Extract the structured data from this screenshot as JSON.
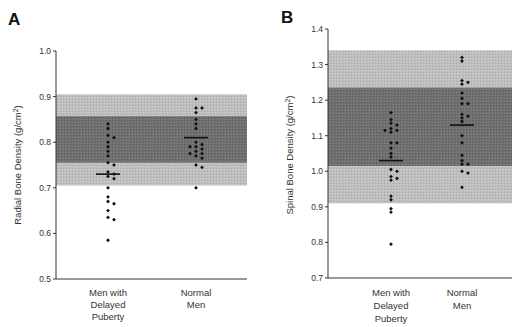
{
  "chart_data": [
    {
      "type": "scatter",
      "panel_label": "A",
      "title": "",
      "xlabel": "",
      "ylabel": "Radial Bone Density (g/cm²)",
      "ylabel_base": "Radial Bone Density (g/cm",
      "ylabel_sup": "2",
      "ylabel_end": ")",
      "ylim": [
        0.5,
        1.0
      ],
      "yticks": [
        "1.0",
        "0.9",
        "0.8",
        "0.7",
        "0.6",
        "0.5"
      ],
      "grid": false,
      "reference_bands": {
        "outer": {
          "low": 0.705,
          "high": 0.905,
          "color": "#bdbdbd"
        },
        "inner": {
          "low": 0.755,
          "high": 0.857,
          "color": "#6e6e6e"
        }
      },
      "categories": [
        "Men with Delayed Puberty",
        "Normal Men"
      ],
      "category_lines": [
        [
          "Men with",
          "Delayed",
          "Puberty"
        ],
        [
          "Normal",
          "Men"
        ]
      ],
      "series": [
        {
          "name": "Men with Delayed Puberty",
          "mean": 0.73,
          "values": [
            0.84,
            0.83,
            0.815,
            0.81,
            0.8,
            0.79,
            0.78,
            0.77,
            0.755,
            0.75,
            0.735,
            0.73,
            0.725,
            0.72,
            0.7,
            0.68,
            0.67,
            0.665,
            0.65,
            0.635,
            0.63,
            0.585
          ]
        },
        {
          "name": "Normal Men",
          "mean": 0.81,
          "values": [
            0.895,
            0.875,
            0.875,
            0.865,
            0.85,
            0.84,
            0.83,
            0.8,
            0.795,
            0.79,
            0.79,
            0.785,
            0.78,
            0.775,
            0.775,
            0.77,
            0.765,
            0.75,
            0.745,
            0.7
          ]
        }
      ]
    },
    {
      "type": "scatter",
      "panel_label": "B",
      "title": "",
      "xlabel": "",
      "ylabel": "Spinal Bone Density (g/cm²)",
      "ylabel_base": "Spinal Bone Density (g/cm",
      "ylabel_sup": "2",
      "ylabel_end": ")",
      "ylim": [
        0.7,
        1.4
      ],
      "yticks": [
        "1.4",
        "1.3",
        "1.2",
        "1.1",
        "1.0",
        "0.9",
        "0.8",
        "0.7"
      ],
      "grid": false,
      "reference_bands": {
        "outer": {
          "low": 0.91,
          "high": 1.34,
          "color": "#c4c4c4"
        },
        "inner": {
          "low": 1.015,
          "high": 1.235,
          "color": "#767676"
        }
      },
      "categories": [
        "Men with Delayed Puberty",
        "Normal Men"
      ],
      "category_lines": [
        [
          "Men with",
          "Delayed",
          "Puberty"
        ],
        [
          "Normal",
          "Men"
        ]
      ],
      "series": [
        {
          "name": "Men with Delayed Puberty",
          "mean": 1.03,
          "values": [
            1.165,
            1.145,
            1.135,
            1.13,
            1.12,
            1.115,
            1.115,
            1.11,
            1.08,
            1.08,
            1.065,
            1.05,
            1.04,
            1.005,
            1.0,
            0.985,
            0.98,
            0.975,
            0.93,
            0.92,
            0.895,
            0.885,
            0.795
          ]
        },
        {
          "name": "Normal Men",
          "mean": 1.13,
          "values": [
            1.32,
            1.31,
            1.255,
            1.25,
            1.245,
            1.22,
            1.205,
            1.19,
            1.19,
            1.16,
            1.155,
            1.15,
            1.14,
            1.1,
            1.08,
            1.045,
            1.03,
            1.02,
            1.02,
            1.0,
            0.995,
            0.955
          ]
        }
      ]
    }
  ]
}
